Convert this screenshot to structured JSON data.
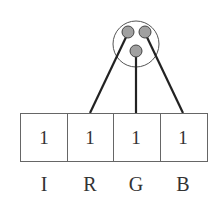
{
  "diagram": {
    "pixel": {
      "outline_color": "#444444",
      "dot_fill": "#a0a0a0",
      "dots": [
        "red",
        "green",
        "blue"
      ]
    },
    "cells": [
      {
        "label": "I",
        "value": "1"
      },
      {
        "label": "R",
        "value": "1"
      },
      {
        "label": "G",
        "value": "1"
      },
      {
        "label": "B",
        "value": "1"
      }
    ],
    "line_color": "#222222",
    "box_color": "#666666"
  }
}
